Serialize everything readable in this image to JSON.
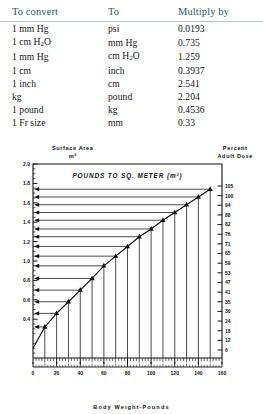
{
  "table": {
    "headers": [
      "To convert",
      "To",
      "Multiply by"
    ],
    "rows": [
      {
        "from": "1 mm Hg",
        "from_sub": "",
        "to": "psi",
        "to_sub": "",
        "factor": "0.0193"
      },
      {
        "from": "1 cm H",
        "from_sub": "2",
        "from_tail": "O",
        "to": "mm Hg",
        "to_sub": "",
        "factor": "0.735"
      },
      {
        "from": "1 mm Hg",
        "from_sub": "",
        "to": "cm H",
        "to_sub": "2",
        "to_tail": "O",
        "factor": "1.259"
      },
      {
        "from": "1 cm",
        "from_sub": "",
        "to": "inch",
        "to_sub": "",
        "factor": "0.3937"
      },
      {
        "from": "1 inch",
        "from_sub": "",
        "to": "cm",
        "to_sub": "",
        "factor": "2.541"
      },
      {
        "from": "kg",
        "from_sub": "",
        "to": "pound",
        "to_sub": "",
        "factor": "2.204"
      },
      {
        "from": "1 pound",
        "from_sub": "",
        "to": "kg",
        "to_sub": "",
        "factor": "0.4536"
      },
      {
        "from": "1 Fr size",
        "from_sub": "",
        "to": "mm",
        "to_sub": "",
        "factor": "0.33"
      }
    ]
  },
  "figure": {
    "left_axis_title_line1": "Surface Area",
    "left_axis_title_line2": "m²",
    "right_axis_title_line1": "Percent",
    "right_axis_title_line2": "Adult Dose",
    "inner_title": "POUNDS TO SQ. METER (m²)",
    "xlabel": "Body Weight-Pounds"
  },
  "chart_data": {
    "type": "line",
    "title": "POUNDS TO SQ. METER (m²)",
    "xlabel": "Body Weight-Pounds",
    "ylabel": "Surface Area m²",
    "y2label": "Percent Adult Dose",
    "xlim": [
      0,
      160
    ],
    "ylim": [
      0,
      2.0
    ],
    "grid": false,
    "legend": null,
    "xticks": [
      0,
      20,
      40,
      60,
      80,
      100,
      120,
      140,
      160
    ],
    "xticklabels": [
      "0",
      "20",
      "40",
      "60",
      "80",
      "100",
      "120",
      "140",
      "160"
    ],
    "yticks": [
      0.4,
      0.6,
      0.8,
      1.0,
      1.2,
      1.4,
      1.6,
      1.8,
      2.0
    ],
    "yticklabels": [
      "0.4",
      "0.6",
      "0.8",
      "1.0",
      "1.2",
      "1.4",
      "1.6",
      "1.8",
      "2.0"
    ],
    "y2_values": [
      6,
      12,
      18,
      24,
      30,
      35,
      41,
      47,
      53,
      59,
      65,
      71,
      76,
      82,
      88,
      94,
      100,
      105
    ],
    "y2ticklabels": [
      "6",
      "12",
      "18",
      "24",
      "30",
      "35",
      "41",
      "47",
      "53",
      "59",
      "65",
      "71",
      "76",
      "82",
      "88",
      "94",
      "100",
      "105"
    ],
    "x": [
      10,
      20,
      30,
      40,
      50,
      60,
      70,
      80,
      90,
      100,
      110,
      120,
      130,
      140,
      150
    ],
    "values": [
      0.32,
      0.46,
      0.58,
      0.7,
      0.82,
      0.95,
      1.05,
      1.15,
      1.25,
      1.33,
      1.42,
      1.5,
      1.58,
      1.66,
      1.74
    ],
    "marker": "triangle",
    "annotation": "Horizontal arrows from each curve point to the left surface-area axis; vertical drop lines from each point to the x axis."
  }
}
